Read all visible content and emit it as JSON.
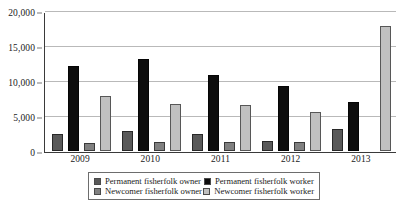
{
  "chart_data": {
    "type": "bar",
    "title": "",
    "subtitle": "",
    "xlabel": "",
    "ylabel": "",
    "categories": [
      "2009",
      "2010",
      "2011",
      "2012",
      "2013"
    ],
    "ylim": [
      0,
      20000
    ],
    "y_ticks": [
      0,
      5000,
      10000,
      15000,
      20000
    ],
    "y_tick_labels": [
      "0",
      "5,000",
      "10,000",
      "15,000",
      "20,000"
    ],
    "grid": true,
    "legend_position": "bottom",
    "series": [
      {
        "name": "Permanent fisherfolk owner",
        "color": "#595959",
        "values": [
          2400,
          2800,
          2400,
          1500,
          3200
        ]
      },
      {
        "name": "Permanent fisherfolk worker",
        "color": "#0d0d0d",
        "values": [
          12100,
          13200,
          10900,
          9300,
          7000
        ]
      },
      {
        "name": "Newcomer fisherfolk owner",
        "color": "#808080",
        "values": [
          1200,
          1250,
          1300,
          1300,
          0
        ]
      },
      {
        "name": "Newcomer fisherfolk worker",
        "color": "#c0c0c0",
        "values": [
          7900,
          6700,
          6600,
          5600,
          17900
        ]
      }
    ]
  },
  "legend": {
    "items": [
      {
        "label": "Permanent fisherfolk owner",
        "color": "#595959"
      },
      {
        "label": "Permanent fisherfolk worker",
        "color": "#0d0d0d"
      },
      {
        "label": "Newcomer fisherfolk owner",
        "color": "#808080"
      },
      {
        "label": "Newcomer fisherfolk worker",
        "color": "#c0c0c0"
      }
    ]
  }
}
